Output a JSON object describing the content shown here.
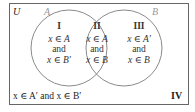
{
  "diagram": {
    "type": "venn",
    "universe_label": "U",
    "sets": [
      {
        "name": "A",
        "label": "A"
      },
      {
        "name": "B",
        "label": "B"
      }
    ],
    "regions": [
      {
        "id": "I",
        "numeral": "I",
        "line1": "x ∈ A",
        "line2": "and",
        "line3": "x ∈ B′"
      },
      {
        "id": "II",
        "numeral": "II",
        "line1": "x ∈ A",
        "line2": "and",
        "line3": "x ∈ B"
      },
      {
        "id": "III",
        "numeral": "III",
        "line1": "x ∈ A′",
        "line2": "and",
        "line3": "x ∈ B"
      },
      {
        "id": "IV",
        "numeral": "IV",
        "description": "x ∈ A′ and x ∈ B′"
      }
    ],
    "colors": {
      "border": "#666666",
      "circle": "#8a8a8a",
      "set_label": "#9a9a9a",
      "text": "#222222"
    }
  }
}
